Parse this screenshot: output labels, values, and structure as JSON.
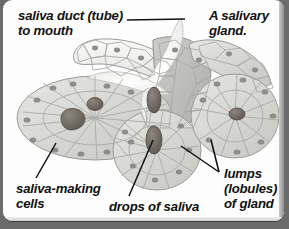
{
  "figure": {
    "kind": "anatomical-illustration",
    "labels": {
      "duct": "saliva duct (tube)\nto mouth",
      "gland": "A salivary\ngland.",
      "cells": "saliva-making\ncells",
      "drops": "drops of saliva",
      "lumps": "lumps\n(lobules)\nof gland"
    },
    "colors": {
      "card_background": "#fdfdfd",
      "page_background": "#6b6b6b",
      "text": "#111111",
      "leader_line": "#111111",
      "cell_fill_light": "#f2f2f0",
      "cell_fill_mid": "#d9d9d6",
      "cell_fill_dark": "#b9b9b6",
      "duct_lumen": "#ffffff",
      "saliva_drop": "#6f6a63",
      "nucleus": "#8f8f8c"
    }
  }
}
